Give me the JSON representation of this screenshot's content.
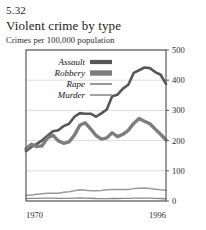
{
  "figure": {
    "number": "5.32",
    "title": "Violent crime by type",
    "subtitle": "Crimes per 100,000 population"
  },
  "colors": {
    "assault": "#565656",
    "robbery": "#7d7d7d",
    "rape": "#9a9a9a",
    "murder": "#8a8a8a",
    "frame": "#5a5a5a",
    "grid": "#d2d2d2",
    "text": "#1b1b1b"
  },
  "axes": {
    "y_ticks": [
      "0",
      "100",
      "200",
      "300",
      "400",
      "500"
    ],
    "x_ticks": [
      "1970",
      "1996"
    ]
  },
  "legend": {
    "items": [
      {
        "label": "Assault",
        "key": "assault"
      },
      {
        "label": "Robbery",
        "key": "robbery"
      },
      {
        "label": "Rape",
        "key": "rape"
      },
      {
        "label": "Murder",
        "key": "murder"
      }
    ]
  },
  "chart_data": {
    "type": "line",
    "title": "Violent crime by type",
    "subtitle": "Crimes per 100,000 population",
    "xlabel": "",
    "ylabel": "Crimes per 100,000 population",
    "xlim": [
      1970,
      1996
    ],
    "ylim": [
      0,
      500
    ],
    "yticks": [
      0,
      100,
      200,
      300,
      400,
      500
    ],
    "xticks": [
      1970,
      1996
    ],
    "grid": "horizontal",
    "legend_position": "upper-left-inside",
    "x": [
      1970,
      1971,
      1972,
      1973,
      1974,
      1975,
      1976,
      1977,
      1978,
      1979,
      1980,
      1981,
      1982,
      1983,
      1984,
      1985,
      1986,
      1987,
      1988,
      1989,
      1990,
      1991,
      1992,
      1993,
      1994,
      1995,
      1996
    ],
    "series": [
      {
        "name": "Assault",
        "color": "#565656",
        "width": 2.6,
        "values": [
          165,
          179,
          189,
          201,
          216,
          231,
          234,
          248,
          256,
          279,
          291,
          289,
          289,
          279,
          290,
          303,
          347,
          352,
          372,
          385,
          424,
          433,
          442,
          440,
          427,
          418,
          388
        ]
      },
      {
        "name": "Robbery",
        "color": "#7d7d7d",
        "width": 3.4,
        "values": [
          172,
          188,
          180,
          183,
          209,
          218,
          199,
          191,
          196,
          218,
          251,
          259,
          239,
          217,
          205,
          209,
          226,
          213,
          221,
          234,
          257,
          273,
          264,
          256,
          238,
          221,
          202
        ]
      },
      {
        "name": "Rape",
        "color": "#9a9a9a",
        "width": 1.5,
        "values": [
          18,
          20,
          22,
          24,
          26,
          26,
          26,
          29,
          31,
          34,
          37,
          36,
          34,
          34,
          35,
          37,
          38,
          38,
          38,
          38,
          41,
          42,
          43,
          41,
          39,
          37,
          36
        ]
      },
      {
        "name": "Murder",
        "color": "#8a8a8a",
        "width": 1.3,
        "values": [
          7.9,
          8.6,
          9.0,
          9.4,
          9.8,
          9.6,
          8.8,
          8.8,
          9.0,
          9.7,
          10.2,
          9.8,
          9.1,
          8.3,
          7.9,
          8.0,
          8.6,
          8.3,
          8.4,
          8.7,
          9.4,
          9.8,
          9.3,
          9.5,
          9.0,
          8.2,
          7.4
        ]
      }
    ]
  }
}
